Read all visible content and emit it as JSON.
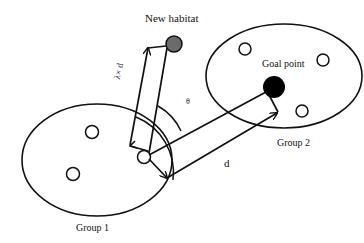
{
  "diagram": {
    "labels": {
      "new_habitat": "New habitat",
      "goal_point": "Goal point",
      "group1": "Group 1",
      "group2": "Group 2",
      "lambda_d": "λ× d",
      "theta": "θ",
      "d": "d"
    },
    "colors": {
      "stroke": "#111111",
      "new_habitat_fill": "#6b6b6b",
      "goal_point_fill": "#000000",
      "background": "#ffffff"
    },
    "groups": [
      {
        "name": "Group 1",
        "members": 3
      },
      {
        "name": "Group 2",
        "members": 3
      }
    ]
  }
}
